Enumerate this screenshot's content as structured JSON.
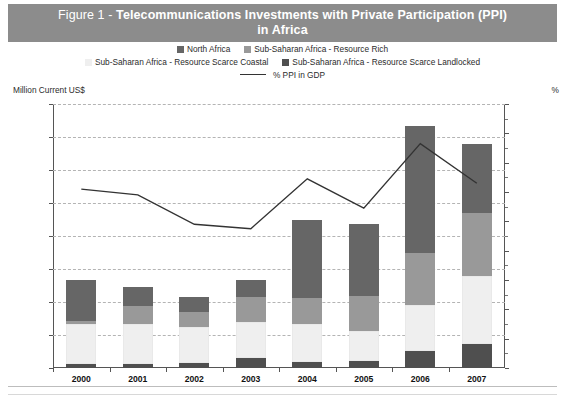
{
  "banner": {
    "figure_prefix": "Figure 1 - ",
    "title_line1": "Telecommunications Investments with Private Participation (PPI)",
    "title_line2": "in Africa",
    "bg_color": "#8c8c8c",
    "text_color": "#ffffff"
  },
  "legend": {
    "row1": [
      {
        "label": "North Africa",
        "color": "#666666",
        "marker": "square"
      },
      {
        "label": "Sub-Saharan Africa - Resource Rich",
        "color": "#999999",
        "marker": "square"
      }
    ],
    "row2": [
      {
        "label": "Sub-Saharan Africa - Resource Scarce Coastal",
        "color": "#efefef",
        "marker": "square"
      },
      {
        "label": "Sub-Saharan Africa - Resource Scarce Landlocked",
        "color": "#4f4f4f",
        "marker": "square"
      }
    ],
    "row3": [
      {
        "label": "% PPI in GDP",
        "color": "#333333",
        "marker": "line"
      }
    ]
  },
  "axes": {
    "left_caption": "Million Current US$",
    "right_caption": "%",
    "left_ticks": [
      "16000",
      "14000",
      "12000",
      "10000",
      "8000",
      "6000",
      "4000",
      "2000",
      "0"
    ],
    "right_ticks": [
      "1.8",
      "1.6",
      "1.4",
      "1.2",
      "1.0",
      "0.8",
      "0.6",
      "0.4",
      "0.2",
      "0.0"
    ]
  },
  "chart_data": {
    "type": "bar",
    "title": "Figure 1 - Telecommunications Investments with Private Participation (PPI) in Africa",
    "xlabel": "",
    "ylabel": "Million Current US$",
    "y2label": "%",
    "ylim": [
      0,
      16000
    ],
    "y2lim": [
      0.0,
      1.8
    ],
    "grid": true,
    "legend_position": "top",
    "stacked": true,
    "categories": [
      "2000",
      "2001",
      "2002",
      "2003",
      "2004",
      "2005",
      "2006",
      "2007"
    ],
    "series": [
      {
        "name": "Sub-Saharan Africa - Resource Scarce Landlocked",
        "color": "#4f4f4f",
        "axis": "left",
        "values": [
          250,
          240,
          330,
          620,
          350,
          400,
          1050,
          1480
        ]
      },
      {
        "name": "Sub-Saharan Africa - Resource Scarce Coastal",
        "color": "#efefef",
        "axis": "left",
        "values": [
          2400,
          2410,
          2170,
          2140,
          2300,
          1850,
          2750,
          4120
        ]
      },
      {
        "name": "Sub-Saharan Africa - Resource Rich",
        "color": "#999999",
        "axis": "left",
        "values": [
          180,
          1110,
          920,
          1550,
          1600,
          2100,
          3200,
          3800
        ]
      },
      {
        "name": "North Africa",
        "color": "#666666",
        "axis": "left",
        "values": [
          2520,
          1140,
          880,
          1040,
          4750,
          4350,
          7650,
          4200
        ]
      }
    ],
    "line_series": {
      "name": "% PPI in GDP",
      "color": "#333333",
      "axis": "right",
      "values": [
        1.22,
        1.18,
        0.98,
        0.95,
        1.29,
        1.09,
        1.53,
        1.26
      ]
    },
    "totals": [
      5350,
      4900,
      4300,
      5350,
      9000,
      8700,
      14650,
      13600
    ]
  }
}
